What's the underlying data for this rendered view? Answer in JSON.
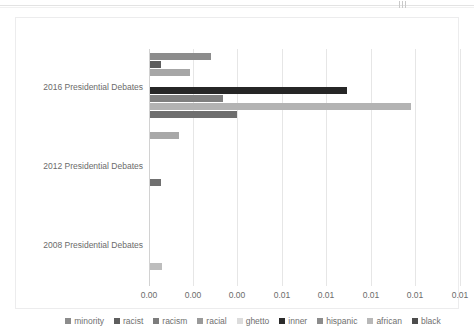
{
  "chart_data": {
    "type": "bar",
    "orientation": "horizontal",
    "title": "",
    "xlabel": "",
    "ylabel": "",
    "categories": [
      "2016 Presidential Debates",
      "2012 Presidential Debates",
      "2008 Presidential Debates"
    ],
    "xlim": [
      0.0,
      0.014
    ],
    "xticks": [
      0.0,
      0.002,
      0.004,
      0.006,
      0.008,
      0.01,
      0.012,
      0.014
    ],
    "xticklabels": [
      "0.00",
      "0.00",
      "0.00",
      "0.01",
      "0.01",
      "0.01",
      "0.01",
      "0.01"
    ],
    "grid": true,
    "legend_position": "bottom",
    "series": [
      {
        "name": "minority",
        "color": "#8c8c8c",
        "values": [
          0.00275,
          0.0,
          0.0
        ]
      },
      {
        "name": "racist",
        "color": "#5e5e5e",
        "values": [
          0.0005,
          0.0,
          0.0
        ]
      },
      {
        "name": "racism",
        "color": "#a6a6a6",
        "values": [
          0.0018,
          0.0,
          0.0
        ]
      },
      {
        "name": "racial",
        "color": "#767676",
        "values": [
          0.0,
          0.0,
          0.0
        ]
      },
      {
        "name": "ghetto",
        "color": "#d9d9d9",
        "values": [
          0.0,
          0.0,
          0.0
        ]
      },
      {
        "name": "inner",
        "color": "#262626",
        "values": [
          0.0089,
          0.0,
          0.0
        ]
      },
      {
        "name": "hispanic",
        "color": "#8c8c8c",
        "values": [
          0.0033,
          0.0,
          0.0
        ]
      },
      {
        "name": "african",
        "color": "#b3b3b3",
        "values": [
          0.0118,
          0.0,
          0.0
        ]
      },
      {
        "name": "black",
        "color": "#6e6e6e",
        "values": [
          0.0031,
          0.00075,
          0.0008
        ]
      }
    ],
    "extra_bars": [
      {
        "series": "black",
        "category_index": 0,
        "value": 0.0013,
        "color": "#a8a8a8"
      }
    ]
  },
  "legend": {
    "items": [
      {
        "label": "minority",
        "color": "#8c8c8c"
      },
      {
        "label": "racist",
        "color": "#5e5e5e"
      },
      {
        "label": "racism",
        "color": "#7d7d7d"
      },
      {
        "label": "racial",
        "color": "#9a9a9a"
      },
      {
        "label": "ghetto",
        "color": "#dcdcdc"
      },
      {
        "label": "inner",
        "color": "#2b2b2b"
      },
      {
        "label": "hispanic",
        "color": "#8c8c8c"
      },
      {
        "label": "african",
        "color": "#b8b8b8"
      },
      {
        "label": "black",
        "color": "#4d4d4d"
      }
    ]
  },
  "bars": [
    {
      "name": "2016-minority",
      "group": 0,
      "label": "minority",
      "value": 0.00275,
      "color": "#8c8c8c",
      "top": 4,
      "len": 61
    },
    {
      "name": "2016-racist",
      "group": 0,
      "label": "racist",
      "value": 0.0005,
      "color": "#5e5e5e",
      "top": 12,
      "len": 11
    },
    {
      "name": "2016-racism",
      "group": 0,
      "label": "racism",
      "value": 0.0018,
      "color": "#a6a6a6",
      "top": 20,
      "len": 40
    },
    {
      "name": "2016-inner",
      "group": 0,
      "label": "inner",
      "value": 0.0089,
      "color": "#262626",
      "top": 38,
      "len": 197
    },
    {
      "name": "2016-hispanic",
      "group": 0,
      "label": "hispanic",
      "value": 0.0033,
      "color": "#7f7f7f",
      "top": 46,
      "len": 73
    },
    {
      "name": "2016-african",
      "group": 0,
      "label": "african",
      "value": 0.0118,
      "color": "#b3b3b3",
      "top": 54,
      "len": 261
    },
    {
      "name": "2016-black",
      "group": 0,
      "label": "black",
      "value": 0.0031,
      "color": "#6e6e6e",
      "top": 62,
      "len": 87
    },
    {
      "name": "2016-ghetto",
      "group": 0,
      "label": "ghetto",
      "value": 0.0013,
      "color": "#a8a8a8",
      "top": 83,
      "len": 29
    },
    {
      "name": "2012-black",
      "group": 1,
      "label": "black",
      "value": 0.00075,
      "color": "#707070",
      "top": 130,
      "len": 11
    },
    {
      "name": "2008-black",
      "group": 2,
      "label": "black",
      "value": 0.0008,
      "color": "#bdbdbd",
      "top": 214,
      "len": 12
    }
  ],
  "category_labels": [
    {
      "text": "2016 Presidential Debates",
      "top": 33
    },
    {
      "text": "2012 Presidential Debates",
      "top": 112
    },
    {
      "text": "2008 Presidential Debates",
      "top": 191
    }
  ],
  "gridlines": [
    0,
    44,
    88,
    133,
    177,
    222,
    266,
    311
  ]
}
